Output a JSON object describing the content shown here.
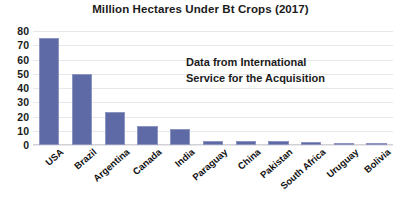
{
  "chart_data": {
    "type": "bar",
    "title": "Million Hectares Under Bt Crops (2017)",
    "xlabel": "",
    "ylabel": "",
    "ylim": [
      0,
      80
    ],
    "ytick_step": 10,
    "yticks": [
      "80",
      "70",
      "60",
      "50",
      "40",
      "30",
      "20",
      "10",
      "0"
    ],
    "grid": true,
    "legend": "none",
    "bar_color": "#5d6aa6",
    "bar_border_color": "#8b95c0",
    "categories": [
      "USA",
      "Brazil",
      "Argentina",
      "Canada",
      "India",
      "Paraguay",
      "China",
      "Pakistan",
      "South Africa",
      "Uruguay",
      "Bolivia"
    ],
    "values": [
      75,
      50,
      23,
      13,
      11.5,
      3,
      2.8,
      2.8,
      2.3,
      1.3,
      1.2
    ],
    "annotations": [
      {
        "name": "data-source-note",
        "lines": [
          "Data from International",
          "Service for the Acquisition"
        ]
      }
    ]
  }
}
